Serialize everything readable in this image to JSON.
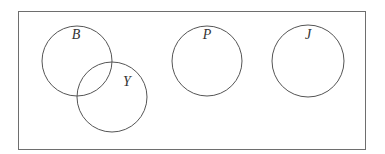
{
  "diagram": {
    "type": "venn",
    "universe": {
      "x": 18.5,
      "y": 11.5,
      "width": 347,
      "height": 138,
      "stroke": "#6e6e6e"
    },
    "sets": [
      {
        "label": "B",
        "cx": 77,
        "cy": 61,
        "r": 35,
        "label_x": 76,
        "label_y": 39
      },
      {
        "label": "Y",
        "cx": 112,
        "cy": 97,
        "r": 35,
        "label_x": 127,
        "label_y": 86
      },
      {
        "label": "P",
        "cx": 207,
        "cy": 61,
        "r": 35,
        "label_x": 207,
        "label_y": 39
      },
      {
        "label": "J",
        "cx": 308,
        "cy": 61,
        "r": 36,
        "label_x": 308,
        "label_y": 39
      }
    ],
    "relationships": [
      {
        "sets": [
          "B",
          "Y"
        ],
        "type": "overlap"
      },
      {
        "sets": [
          "P"
        ],
        "type": "disjoint"
      },
      {
        "sets": [
          "J"
        ],
        "type": "disjoint"
      }
    ],
    "stroke_color": "#555555",
    "text_color": "#333333"
  }
}
